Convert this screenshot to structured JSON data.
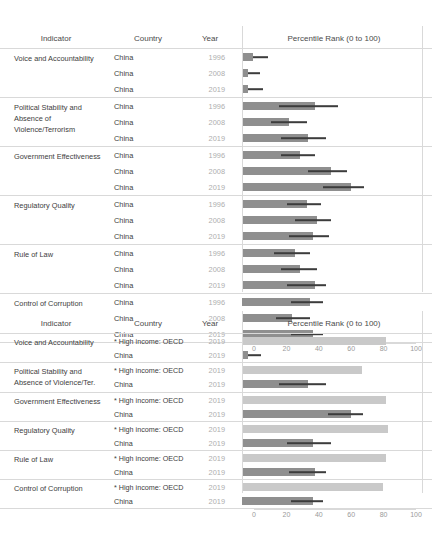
{
  "meta": {
    "axis": {
      "min": 0,
      "max": 100,
      "ticks": [
        0,
        20,
        40,
        60,
        80,
        100
      ]
    },
    "colors": {
      "bar_china": "#8f8f8f",
      "bar_china_dark": "#6f6f6f",
      "bar_oecd": "#c9c9c9",
      "whisker": "#3c3c3c",
      "rule": "#d9d9d9",
      "year_text": "#aeaeae"
    }
  },
  "table1": {
    "headers": {
      "indicator": "Indicator",
      "country": "Country",
      "year": "Year",
      "chart": "Percentile Rank (0 to 100)"
    },
    "groups": [
      {
        "indicator": "Voice and Accountability",
        "rows": [
          {
            "country": "China",
            "year": "1996",
            "value": 7,
            "low": 7,
            "high": 16
          },
          {
            "country": "China",
            "year": "2008",
            "value": 4,
            "low": 4,
            "high": 11
          },
          {
            "country": "China",
            "year": "2019",
            "value": 4,
            "low": 4,
            "high": 13
          }
        ]
      },
      {
        "indicator": "Political Stability and Absence of Violence/Terrorism",
        "rows": [
          {
            "country": "China",
            "year": "1996",
            "value": 45,
            "low": 23,
            "high": 59
          },
          {
            "country": "China",
            "year": "2008",
            "value": 29,
            "low": 18,
            "high": 40
          },
          {
            "country": "China",
            "year": "2019",
            "value": 41,
            "low": 24,
            "high": 52
          }
        ]
      },
      {
        "indicator": "Government Effectiveness",
        "rows": [
          {
            "country": "China",
            "year": "1996",
            "value": 36,
            "low": 24,
            "high": 45
          },
          {
            "country": "China",
            "year": "2008",
            "value": 55,
            "low": 41,
            "high": 65
          },
          {
            "country": "China",
            "year": "2019",
            "value": 67,
            "low": 50,
            "high": 75
          }
        ]
      },
      {
        "indicator": "Regulatory Quality",
        "rows": [
          {
            "country": "China",
            "year": "1996",
            "value": 40,
            "low": 28,
            "high": 49
          },
          {
            "country": "China",
            "year": "2008",
            "value": 46,
            "low": 33,
            "high": 55
          },
          {
            "country": "China",
            "year": "2019",
            "value": 44,
            "low": 29,
            "high": 54
          }
        ]
      },
      {
        "indicator": "Rule of Law",
        "rows": [
          {
            "country": "China",
            "year": "1996",
            "value": 33,
            "low": 20,
            "high": 42
          },
          {
            "country": "China",
            "year": "2008",
            "value": 36,
            "low": 24,
            "high": 46
          },
          {
            "country": "China",
            "year": "2019",
            "value": 45,
            "low": 28,
            "high": 52
          }
        ]
      },
      {
        "indicator": "Control of Corruption",
        "rows": [
          {
            "country": "China",
            "year": "1996",
            "value": 42,
            "low": 30,
            "high": 50
          },
          {
            "country": "China",
            "year": "2008",
            "value": 31,
            "low": 21,
            "high": 42
          },
          {
            "country": "China",
            "year": "2019",
            "value": 44,
            "low": 30,
            "high": 50
          }
        ]
      }
    ]
  },
  "table2": {
    "headers": {
      "indicator": "Indicator",
      "country": "Country",
      "year": "Year",
      "chart": "Percentile Rank (0 to 100)"
    },
    "groups": [
      {
        "indicator": "Voice and Accountability",
        "rows": [
          {
            "country": "* High income: OECD",
            "year": "2019",
            "value": 89,
            "low": 89,
            "high": 89,
            "series": "oecd"
          },
          {
            "country": "China",
            "year": "2019",
            "value": 4,
            "low": 4,
            "high": 12,
            "series": "china"
          }
        ]
      },
      {
        "indicator": "Political Stability and Absence of Violence/Ter.",
        "rows": [
          {
            "country": "* High income: OECD",
            "year": "2019",
            "value": 74,
            "low": 74,
            "high": 74,
            "series": "oecd"
          },
          {
            "country": "China",
            "year": "2019",
            "value": 41,
            "low": 23,
            "high": 52,
            "series": "china"
          }
        ]
      },
      {
        "indicator": "Government Effectiveness",
        "rows": [
          {
            "country": "* High income: OECD",
            "year": "2019",
            "value": 89,
            "low": 89,
            "high": 89,
            "series": "oecd"
          },
          {
            "country": "China",
            "year": "2019",
            "value": 67,
            "low": 53,
            "high": 75,
            "series": "china"
          }
        ]
      },
      {
        "indicator": "Regulatory Quality",
        "rows": [
          {
            "country": "* High income: OECD",
            "year": "2019",
            "value": 90,
            "low": 90,
            "high": 90,
            "series": "oecd"
          },
          {
            "country": "China",
            "year": "2019",
            "value": 44,
            "low": 28,
            "high": 55,
            "series": "china"
          }
        ]
      },
      {
        "indicator": "Rule of Law",
        "rows": [
          {
            "country": "* High income: OECD",
            "year": "2019",
            "value": 89,
            "low": 89,
            "high": 89,
            "series": "oecd"
          },
          {
            "country": "China",
            "year": "2019",
            "value": 45,
            "low": 29,
            "high": 52,
            "series": "china"
          }
        ]
      },
      {
        "indicator": "Control of Corruption",
        "rows": [
          {
            "country": "* High income: OECD",
            "year": "2019",
            "value": 87,
            "low": 87,
            "high": 87,
            "series": "oecd"
          },
          {
            "country": "China",
            "year": "2019",
            "value": 44,
            "low": 30,
            "high": 50,
            "series": "china"
          }
        ]
      }
    ]
  },
  "chart_data": {
    "type": "bar",
    "xlabel": "Percentile Rank (0 to 100)",
    "ylabel": "",
    "xlim": [
      0,
      100
    ],
    "grid": false,
    "legend": "none",
    "panels": [
      {
        "name": "China over time",
        "categories": [
          "Voice and Accountability",
          "Political Stability and Absence of Violence/Terrorism",
          "Government Effectiveness",
          "Regulatory Quality",
          "Rule of Law",
          "Control of Corruption"
        ],
        "series": [
          {
            "name": "1996",
            "values": [
              7,
              45,
              36,
              40,
              33,
              42
            ],
            "error_low": [
              7,
              23,
              24,
              28,
              20,
              30
            ],
            "error_high": [
              16,
              59,
              45,
              49,
              42,
              50
            ]
          },
          {
            "name": "2008",
            "values": [
              4,
              29,
              55,
              46,
              36,
              31
            ],
            "error_low": [
              4,
              18,
              41,
              33,
              24,
              21
            ],
            "error_high": [
              11,
              40,
              65,
              55,
              46,
              42
            ]
          },
          {
            "name": "2019",
            "values": [
              4,
              41,
              67,
              44,
              45,
              44
            ],
            "error_low": [
              4,
              24,
              50,
              29,
              28,
              30
            ],
            "error_high": [
              13,
              52,
              75,
              54,
              52,
              50
            ]
          }
        ]
      },
      {
        "name": "China vs High income: OECD (2019)",
        "categories": [
          "Voice and Accountability",
          "Political Stability and Absence of Violence/Ter.",
          "Government Effectiveness",
          "Regulatory Quality",
          "Rule of Law",
          "Control of Corruption"
        ],
        "series": [
          {
            "name": "* High income: OECD",
            "values": [
              89,
              74,
              89,
              90,
              89,
              87
            ]
          },
          {
            "name": "China",
            "values": [
              4,
              41,
              67,
              44,
              45,
              44
            ],
            "error_low": [
              4,
              23,
              53,
              28,
              29,
              30
            ],
            "error_high": [
              12,
              52,
              75,
              55,
              52,
              50
            ]
          }
        ]
      }
    ]
  }
}
